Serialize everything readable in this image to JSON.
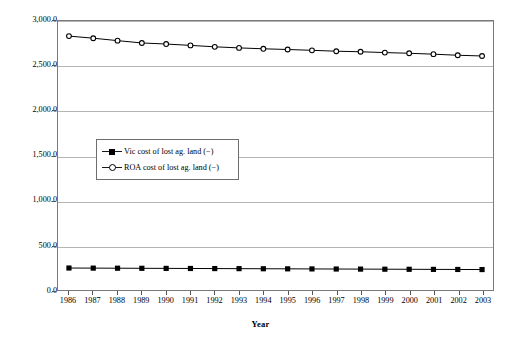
{
  "chart_data": {
    "type": "line",
    "title": "",
    "xlabel": "Year",
    "ylabel": "$ per capita (2002-03 prices)",
    "grid": true,
    "legend_position": "inside-left-middle",
    "x": [
      1986,
      1987,
      1988,
      1989,
      1990,
      1991,
      1992,
      1993,
      1994,
      1995,
      1996,
      1997,
      1998,
      1999,
      2000,
      2001,
      2002,
      2003
    ],
    "xtick_labels": [
      "1986",
      "1987",
      "1988",
      "1989",
      "1990",
      "1991",
      "1992",
      "1993",
      "1994",
      "1995",
      "1996",
      "1997",
      "1998",
      "1999",
      "2000",
      "2001",
      "2002",
      "2003"
    ],
    "ylim": [
      0,
      3000
    ],
    "ytick_values": [
      0,
      500,
      1000,
      1500,
      2000,
      2500,
      3000
    ],
    "ytick_labels": [
      "0.0",
      "500.0",
      "1,000.0",
      "1,500.0",
      "2,000.0",
      "2,500.0",
      "3,000.0"
    ],
    "series": [
      {
        "name": "Vic cost of lost ag. land (−)",
        "marker": "filled-square",
        "color": "#000000",
        "values": [
          245,
          244,
          243,
          242,
          241,
          240,
          239,
          238,
          237,
          236,
          235,
          234,
          233,
          232,
          231,
          230,
          229,
          228
        ]
      },
      {
        "name": "ROA cost of lost ag. land (−)",
        "marker": "open-circle",
        "color": "#000000",
        "values": [
          2832,
          2808,
          2781,
          2755,
          2743,
          2728,
          2712,
          2700,
          2690,
          2682,
          2673,
          2663,
          2657,
          2648,
          2640,
          2630,
          2618,
          2610
        ]
      }
    ]
  },
  "legend": {
    "entries": [
      {
        "label": "Vic cost of lost ag. land (−)"
      },
      {
        "label": "ROA cost of lost ag. land (−)"
      }
    ]
  }
}
